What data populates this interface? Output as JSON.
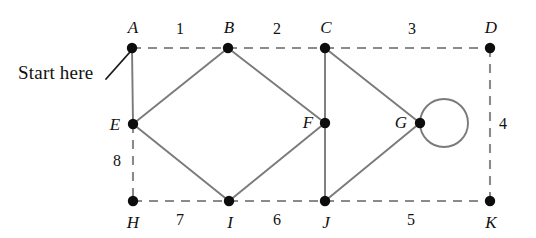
{
  "diagram": {
    "type": "graph",
    "background_color": "#ffffff",
    "node_color": "#0d0d0d",
    "solid_edge_color": "#7a7a7a",
    "dashed_edge_color": "#8a8a8a",
    "annotation": {
      "text": "Start here",
      "points_to": "A",
      "x": 18,
      "y": 72
    },
    "nodes": [
      {
        "id": "A",
        "label": "A",
        "x": 132,
        "y": 48,
        "label_x": 133,
        "label_y": 27
      },
      {
        "id": "B",
        "label": "B",
        "x": 228,
        "y": 48,
        "label_x": 229,
        "label_y": 27
      },
      {
        "id": "C",
        "label": "C",
        "x": 325,
        "y": 48,
        "label_x": 326,
        "label_y": 27
      },
      {
        "id": "D",
        "label": "D",
        "x": 490,
        "y": 48,
        "label_x": 491,
        "label_y": 27
      },
      {
        "id": "E",
        "label": "E",
        "x": 133,
        "y": 124,
        "label_x": 115,
        "label_y": 124
      },
      {
        "id": "F",
        "label": "F",
        "x": 325,
        "y": 123,
        "label_x": 308,
        "label_y": 122
      },
      {
        "id": "G",
        "label": "G",
        "x": 420,
        "y": 123,
        "label_x": 401,
        "label_y": 122
      },
      {
        "id": "H",
        "label": "H",
        "x": 133,
        "y": 201,
        "label_x": 133,
        "label_y": 222
      },
      {
        "id": "I",
        "label": "I",
        "x": 229,
        "y": 201,
        "label_x": 230,
        "label_y": 222
      },
      {
        "id": "J",
        "label": "J",
        "x": 325,
        "y": 201,
        "label_x": 326,
        "label_y": 222
      },
      {
        "id": "K",
        "label": "K",
        "x": 490,
        "y": 201,
        "label_x": 491,
        "label_y": 222
      }
    ],
    "edges": [
      {
        "from": "A",
        "to": "B",
        "style": "dashed",
        "weight": "1",
        "weight_x": 180,
        "weight_y": 29
      },
      {
        "from": "B",
        "to": "C",
        "style": "dashed",
        "weight": "2",
        "weight_x": 277,
        "weight_y": 29
      },
      {
        "from": "C",
        "to": "D",
        "style": "dashed",
        "weight": "3",
        "weight_x": 412,
        "weight_y": 29
      },
      {
        "from": "D",
        "to": "K",
        "style": "dashed",
        "weight": "4",
        "weight_x": 503,
        "weight_y": 124
      },
      {
        "from": "J",
        "to": "K",
        "style": "dashed",
        "weight": "5",
        "weight_x": 411,
        "weight_y": 220
      },
      {
        "from": "I",
        "to": "J",
        "style": "dashed",
        "weight": "6",
        "weight_x": 277,
        "weight_y": 220
      },
      {
        "from": "H",
        "to": "I",
        "style": "dashed",
        "weight": "7",
        "weight_x": 180,
        "weight_y": 220
      },
      {
        "from": "E",
        "to": "H",
        "style": "dashed",
        "weight": "8",
        "weight_x": 117,
        "weight_y": 161
      },
      {
        "from": "A",
        "to": "E",
        "style": "solid",
        "weight": null
      },
      {
        "from": "E",
        "to": "B",
        "style": "solid",
        "weight": null
      },
      {
        "from": "B",
        "to": "F",
        "style": "solid",
        "weight": null
      },
      {
        "from": "E",
        "to": "I",
        "style": "solid",
        "weight": null
      },
      {
        "from": "I",
        "to": "F",
        "style": "solid",
        "weight": null
      },
      {
        "from": "C",
        "to": "F",
        "style": "solid",
        "weight": null
      },
      {
        "from": "C",
        "to": "G",
        "style": "solid",
        "weight": null
      },
      {
        "from": "F",
        "to": "J",
        "style": "solid",
        "weight": null
      },
      {
        "from": "J",
        "to": "G",
        "style": "solid",
        "weight": null
      }
    ],
    "self_loops": [
      {
        "at": "G",
        "center_x": 444,
        "center_y": 123,
        "radius": 24
      }
    ]
  }
}
